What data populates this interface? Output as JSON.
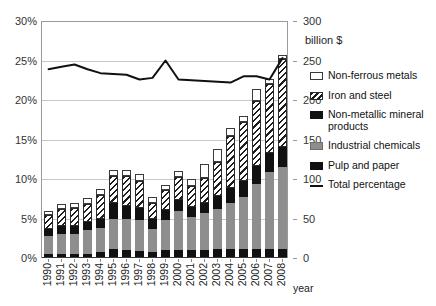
{
  "axes": {
    "left_ticks": [
      "0%",
      "5%",
      "10%",
      "15%",
      "20%",
      "25%",
      "30%"
    ],
    "right_ticks": [
      "0",
      "50",
      "100",
      "150",
      "200",
      "250",
      "300"
    ],
    "right_unit": "billion $",
    "x_title": "year"
  },
  "legend": {
    "items": [
      {
        "label": "Non-ferrous metals",
        "swatch": "nonferrous-swatch-icon",
        "color": "#ffffff"
      },
      {
        "label": "Iron and steel",
        "swatch": "iron-swatch-icon",
        "color": "#1d1d1d"
      },
      {
        "label": "Non-metallic mineral products",
        "swatch": "nonmetallic-swatch-icon",
        "color": "#111111"
      },
      {
        "label": "Industrial chemicals",
        "swatch": "chemicals-swatch-icon",
        "color": "#8e8e8e"
      },
      {
        "label": "Pulp and paper",
        "swatch": "pulp-swatch-icon",
        "color": "#111111"
      },
      {
        "label": "Total percentage",
        "swatch": "line-swatch-icon",
        "color": "#111111"
      }
    ]
  },
  "chart_data": {
    "type": "bar",
    "subtype": "stacked-bar-with-line-overlay",
    "title": "",
    "xlabel": "year",
    "ylabel": "",
    "ylabel_right": "billion $",
    "ylim": [
      0,
      30
    ],
    "ylim_right": [
      0,
      300
    ],
    "ytick_step": 5,
    "ytick_step_right": 50,
    "grid": true,
    "legend_position": "right",
    "categories": [
      "1990",
      "1991",
      "1992",
      "1993",
      "1994",
      "1995",
      "1996",
      "1997",
      "1998",
      "1999",
      "2000",
      "2001",
      "2002",
      "2003",
      "2004",
      "2005",
      "2006",
      "2007",
      "2008"
    ],
    "series": [
      {
        "name": "Pulp and paper",
        "color": "#111111",
        "pattern": "solid-black",
        "values": [
          0.5,
          0.5,
          0.5,
          0.5,
          0.8,
          1.2,
          1.0,
          0.9,
          0.7,
          1.0,
          1.0,
          1.0,
          1.0,
          1.1,
          1.1,
          1.2,
          1.2,
          1.2,
          1.2
        ]
      },
      {
        "name": "Industrial chemicals",
        "color": "#8e8e8e",
        "pattern": "solid-gray",
        "values": [
          2.3,
          2.5,
          2.6,
          3.0,
          3.0,
          3.8,
          4.0,
          3.9,
          3.0,
          3.8,
          4.9,
          4.2,
          4.7,
          5.1,
          5.9,
          6.5,
          8.2,
          9.7,
          10.3
        ]
      },
      {
        "name": "Non-metallic mineral products",
        "color": "#111111",
        "pattern": "solid-black",
        "values": [
          0.9,
          1.0,
          0.9,
          1.0,
          1.1,
          2.0,
          1.6,
          1.5,
          1.2,
          1.3,
          1.5,
          1.3,
          1.3,
          1.7,
          1.9,
          2.1,
          2.3,
          2.4,
          2.5
        ]
      },
      {
        "name": "Iron and steel",
        "color": "#1d1d1d",
        "pattern": "diagonal-hatch",
        "values": [
          1.8,
          2.2,
          2.3,
          2.4,
          3.1,
          3.4,
          3.8,
          3.5,
          2.1,
          2.5,
          2.8,
          2.6,
          3.1,
          4.3,
          6.5,
          7.4,
          8.2,
          8.7,
          11.2
        ]
      },
      {
        "name": "Non-ferrous metals",
        "color": "#ffffff",
        "pattern": "open-white",
        "values": [
          0.5,
          0.6,
          0.7,
          0.7,
          0.8,
          0.7,
          0.8,
          0.8,
          0.7,
          0.6,
          0.8,
          0.9,
          1.8,
          1.6,
          1.1,
          0.8,
          1.5,
          0.7,
          0.5
        ]
      }
    ],
    "line_series": {
      "name": "Total percentage",
      "color": "#111111",
      "axis": "left",
      "values": [
        23.9,
        24.2,
        24.5,
        23.9,
        23.4,
        23.3,
        23.2,
        22.6,
        22.8,
        25.0,
        22.6,
        22.5,
        22.4,
        22.3,
        22.2,
        23.0,
        23.0,
        22.6,
        25.3
      ]
    }
  }
}
